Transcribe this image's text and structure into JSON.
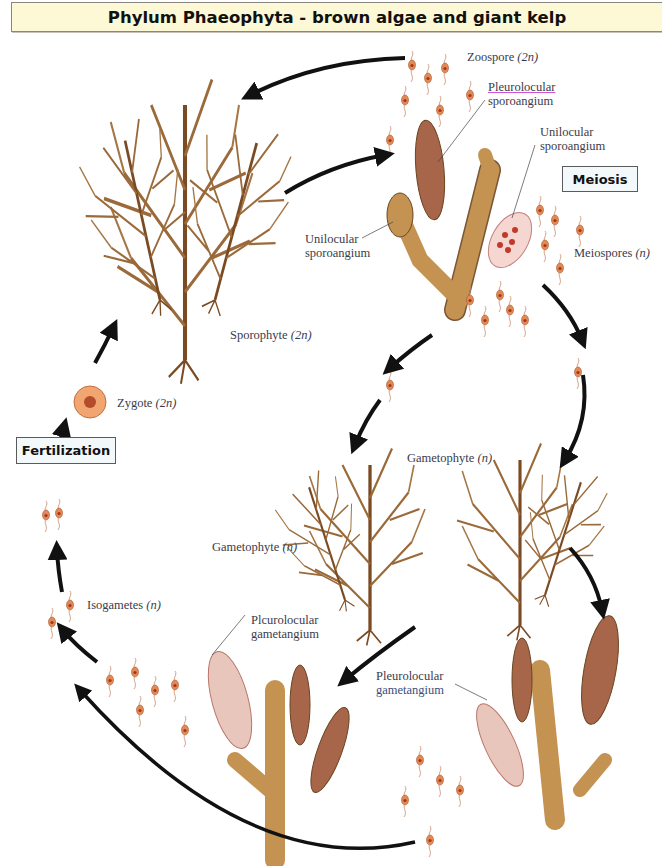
{
  "title": "Phylum Phaeophyta - brown algae and giant kelp",
  "boxes": {
    "meiosis": "Meiosis",
    "fertilization": "Fertilization"
  },
  "labels": {
    "zoospore": {
      "text": "Zoospore",
      "ploidy": "(2n)"
    },
    "pleurolocular_sporoangium": {
      "line1": "Pleurolocular",
      "line2": "sporoangium"
    },
    "unilocular_sporoangium_right": {
      "line1": "Unilocular",
      "line2": "sporoangium"
    },
    "unilocular_sporoangium_left": {
      "line1": "Unilocular",
      "line2": "sporoangium"
    },
    "meiospores": {
      "text": "Meiospores",
      "ploidy": "(n)"
    },
    "sporophyte": {
      "text": "Sporophyte",
      "ploidy": "(2n)"
    },
    "zygote": {
      "text": "Zygote",
      "ploidy": "(2n)"
    },
    "gametophyte_right": {
      "text": "Gametophyte",
      "ploidy": "(n)"
    },
    "gametophyte_left": {
      "text": "Gametophyte",
      "ploidy": "(n)"
    },
    "isogametes": {
      "text": "Isogametes",
      "ploidy": "(n)"
    },
    "pleurolocular_gametangium_left": {
      "line1": "Plcurolocular",
      "line2": "gametangium"
    },
    "pleurolocular_gametangium_right": {
      "line1": "Pleurolocular",
      "line2": "gametangium"
    }
  },
  "colors": {
    "banner_bg": "#fdf9d6",
    "box_bg": "#f3f8fb",
    "algae_brown": "#8b5a2b",
    "cell_fill": "#b8874a",
    "spore_orange": "#e08a55",
    "arrow": "#111111",
    "label_text": "#3b3b4a"
  },
  "stages": [
    "Sporophyte (2n)",
    "Pleurolocular sporoangium",
    "Unilocular sporoangium",
    "Meiosis",
    "Meiospores (n)",
    "Gametophyte (n)",
    "Pleurolocular gametangium",
    "Isogametes (n)",
    "Fertilization",
    "Zygote (2n)"
  ]
}
